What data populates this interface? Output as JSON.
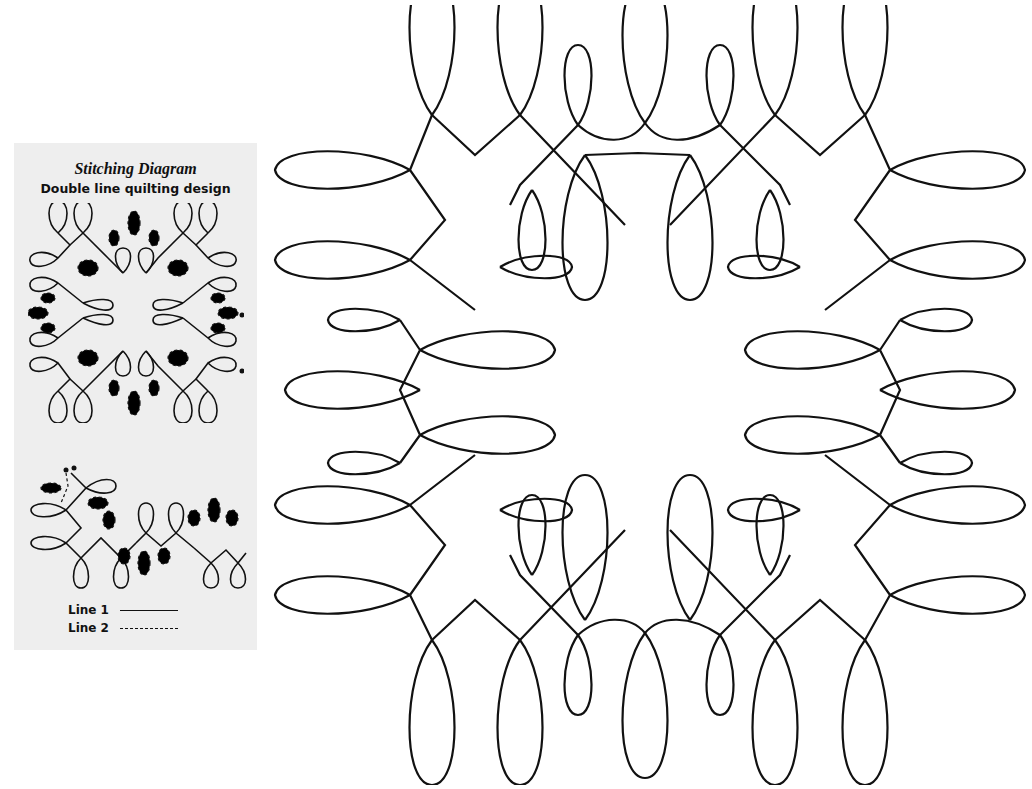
{
  "panel": {
    "title": "Stitching Diagram",
    "subtitle": "Double line quilting design",
    "legend": [
      {
        "label": "Line 1",
        "style": "solid"
      },
      {
        "label": "Line 2",
        "style": "dashed"
      }
    ]
  },
  "colors": {
    "panel_background": "#eeeeee",
    "stroke": "#111111",
    "page_background": "#ffffff"
  }
}
